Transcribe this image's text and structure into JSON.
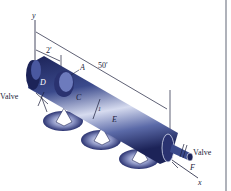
{
  "figure": {
    "axes": {
      "y_label": "y",
      "x_label": "x"
    },
    "dimensions": {
      "short_length": "2′",
      "total_length": "50′"
    },
    "points": {
      "A": "A",
      "C": "C",
      "D": "D",
      "E": "E",
      "F": "F",
      "inner": "1"
    },
    "valves": {
      "left": "Valve",
      "right": "Valve"
    },
    "colors": {
      "pipe_dark": "#1c2358",
      "pipe_mid": "#3b4a8c",
      "pipe_light": "#c9cfe8",
      "shadow": "#2a3270",
      "right_border": "#7a7f8c"
    }
  }
}
